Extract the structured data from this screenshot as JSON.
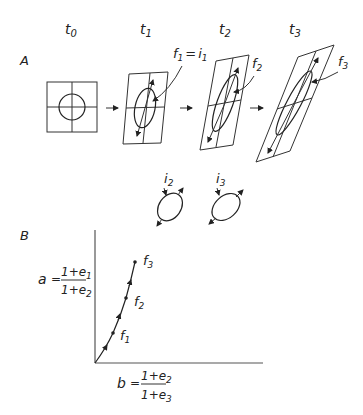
{
  "panel_a": {
    "label": "A",
    "time_labels": [
      {
        "t": "t",
        "sub": "0"
      },
      {
        "t": "t",
        "sub": "1"
      },
      {
        "t": "t",
        "sub": "2"
      },
      {
        "t": "t",
        "sub": "3"
      }
    ],
    "annotations": {
      "f1_eq_i1": {
        "f": "f",
        "fsub": "1",
        "eq": "=",
        "i": "i",
        "isub": "1"
      },
      "f2": {
        "f": "f",
        "sub": "2"
      },
      "f3": {
        "f": "f",
        "sub": "3"
      }
    },
    "increment_ellipses": [
      {
        "i": "i",
        "sub": "2"
      },
      {
        "i": "i",
        "sub": "3"
      }
    ]
  },
  "panel_b": {
    "label": "B",
    "y_axis": {
      "var": "a",
      "eq": "=",
      "num": "1+e",
      "num_sub": "1",
      "den": "1+e",
      "den_sub": "2"
    },
    "x_axis": {
      "var": "b",
      "eq": "=",
      "num": "1+e",
      "num_sub": "2",
      "den": "1+e",
      "den_sub": "3"
    },
    "points": [
      {
        "f": "f",
        "sub": "1"
      },
      {
        "f": "f",
        "sub": "2"
      },
      {
        "f": "f",
        "sub": "3"
      }
    ]
  }
}
